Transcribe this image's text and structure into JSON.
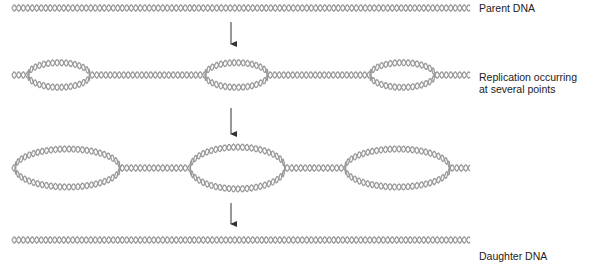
{
  "figure": {
    "stroke_color": "#9a9a9a",
    "arrow_color": "#333333"
  },
  "stages": [
    {
      "label": "Parent DNA",
      "y": 8,
      "bubbles": []
    },
    {
      "label_lines": [
        "Replication occurring",
        "at several points"
      ],
      "y": 75,
      "bubbles": [
        [
          28,
          90,
          13
        ],
        [
          205,
          268,
          13
        ],
        [
          370,
          435,
          13
        ]
      ]
    },
    {
      "label": "",
      "y": 168,
      "bubbles": [
        [
          15,
          120,
          20
        ],
        [
          190,
          285,
          22
        ],
        [
          345,
          450,
          20
        ]
      ]
    },
    {
      "label": "Daughter DNA",
      "y": 240,
      "bubbles": []
    }
  ],
  "arrows": [
    {
      "x": 231,
      "y1": 22,
      "y2": 50
    },
    {
      "x": 231,
      "y1": 108,
      "y2": 140
    },
    {
      "x": 231,
      "y1": 203,
      "y2": 230
    }
  ],
  "labels": {
    "parent": "Parent DNA",
    "replication_line1": "Replication occurring",
    "replication_line2": "at several points",
    "daughter": "Daughter DNA"
  }
}
